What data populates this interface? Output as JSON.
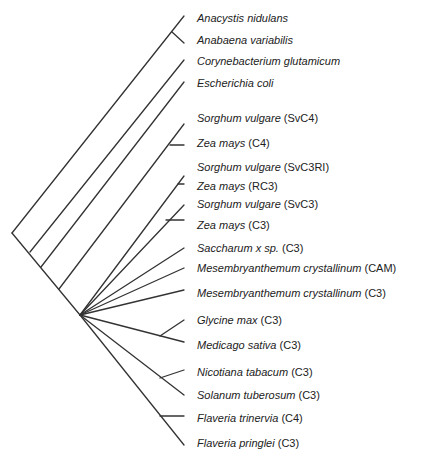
{
  "diagram": {
    "type": "phylogenetic-tree",
    "line_color": "#333333",
    "taxa": [
      {
        "species": "Anacystis nidulans",
        "tag": "",
        "y": 18
      },
      {
        "species": "Anabaena variabilis",
        "tag": "",
        "y": 40
      },
      {
        "species": "Corynebacterium glutamicum",
        "tag": "",
        "y": 61
      },
      {
        "species": "Escherichia coli",
        "tag": "",
        "y": 83
      },
      {
        "species": "Sorghum vulgare",
        "tag": "(SvC4)",
        "y": 118
      },
      {
        "species": "Zea mays",
        "tag": "(C4)",
        "y": 143
      },
      {
        "species": "Sorghum vulgare",
        "tag": "(SvC3RI)",
        "y": 167
      },
      {
        "species": "Zea mays",
        "tag": " (RC3)",
        "y": 186
      },
      {
        "species": "Sorghum vulgare",
        "tag": "(SvC3)",
        "y": 204
      },
      {
        "species": "Zea mays",
        "tag": "(C3)",
        "y": 225
      },
      {
        "species": "Saccharum  x sp.",
        "tag": "(C3)",
        "y": 248
      },
      {
        "species": "Mesembryanthemum crystallinum",
        "tag": "(CAM)",
        "y": 268
      },
      {
        "species": "Mesembryanthemum crystallinum",
        "tag": "(C3)",
        "y": 293
      },
      {
        "species": "Glycine max",
        "tag": "(C3)",
        "y": 320
      },
      {
        "species": "Medicago sativa",
        "tag": " (C3)",
        "y": 345
      },
      {
        "species": "Nicotiana tabacum",
        "tag": " (C3)",
        "y": 372
      },
      {
        "species": "Solanum tuberosum",
        "tag": " (C3)",
        "y": 395
      },
      {
        "species": "Flaveria trinervia",
        "tag": "(C4)",
        "y": 418
      },
      {
        "species": "Flaveria pringlei",
        "tag": "(C3)",
        "y": 443
      }
    ]
  }
}
